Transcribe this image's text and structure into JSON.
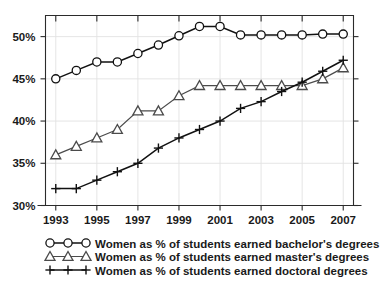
{
  "chart_data": {
    "type": "line",
    "title": "",
    "xlabel": "",
    "ylabel": "",
    "x": [
      1993,
      1994,
      1995,
      1996,
      1997,
      1998,
      1999,
      2000,
      2001,
      2002,
      2003,
      2004,
      2005,
      2006,
      2007
    ],
    "xlim": [
      1992.5,
      2007.5
    ],
    "ylim": [
      30,
      52.5
    ],
    "xtick_labels": [
      "1993",
      "1995",
      "1997",
      "1999",
      "2001",
      "2003",
      "2005",
      "2007"
    ],
    "xticks": [
      1993,
      1995,
      1997,
      1999,
      2001,
      2003,
      2005,
      2007
    ],
    "ytick_labels": [
      "30%",
      "35%",
      "40%",
      "45%",
      "50%"
    ],
    "yticks": [
      30,
      35,
      40,
      45,
      50
    ],
    "grid": true,
    "legend_position": "below-plot",
    "series": [
      {
        "name": "Women as % of students earned bachelor's degrees",
        "marker": "circle",
        "color": "#111111",
        "values": [
          45.0,
          46.0,
          47.0,
          47.0,
          48.0,
          49.0,
          50.1,
          51.2,
          51.2,
          50.2,
          50.2,
          50.2,
          50.2,
          50.3,
          50.3
        ]
      },
      {
        "name": "Women as % of students earned master's degrees",
        "marker": "triangle",
        "color": "#4b4b4b",
        "values": [
          36.0,
          37.0,
          38.0,
          39.0,
          41.2,
          41.2,
          43.0,
          44.2,
          44.2,
          44.2,
          44.2,
          44.2,
          44.2,
          45.0,
          46.3
        ]
      },
      {
        "name": "Women as % of students earned doctoral degrees",
        "marker": "plus",
        "color": "#111111",
        "values": [
          32.0,
          32.0,
          33.0,
          34.0,
          35.0,
          36.8,
          38.0,
          39.0,
          40.0,
          41.5,
          42.3,
          43.5,
          44.6,
          45.9,
          47.2
        ]
      }
    ]
  },
  "legend": {
    "items": [
      {
        "label": "Women as % of students earned bachelor's degrees",
        "marker": "circle"
      },
      {
        "label": "Women as % of students earned master's degrees",
        "marker": "triangle"
      },
      {
        "label": "Women as % of students earned doctoral degrees",
        "marker": "plus"
      }
    ]
  }
}
